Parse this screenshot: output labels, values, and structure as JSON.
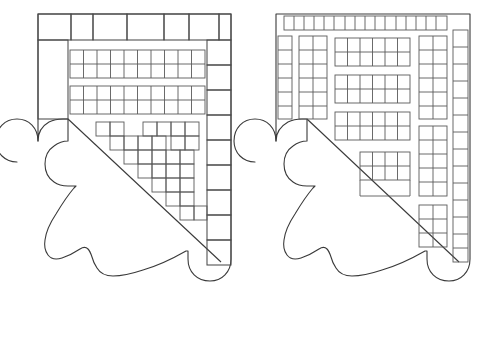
{
  "document": {
    "title": "Corbel Brick Coursing Patterns",
    "background_color": "#ffffff",
    "line_color": "#3a3a3a",
    "brick_line_color": "#4a4a4a",
    "width": 487,
    "height": 342
  },
  "figures": [
    {
      "id": "figure-left",
      "name": "left-corbel-diagram",
      "label": "",
      "description": "Corbel bracket outline with coarse brick coursing, diagonal cut and curved lower profile",
      "origin": {
        "x": 18,
        "y": 8
      },
      "outline": {
        "top_y": 14,
        "left_x": 38,
        "right_x": 231,
        "diagonal_from": {
          "x": 63,
          "y": 119
        },
        "diagonal_to": {
          "x": 221,
          "y": 265
        }
      },
      "courses": {
        "top_row": {
          "cells": 6,
          "rows": 1,
          "widths": [
            33,
            22,
            34,
            37,
            25,
            30
          ]
        },
        "right_column": {
          "cells": 9,
          "rows": 9,
          "columns": 1
        },
        "left_column": {
          "cells": 1,
          "rows": 1,
          "columns": 1
        },
        "band_1": {
          "rows": 2,
          "columns": 10
        },
        "band_2": {
          "rows": 2,
          "columns": 10
        },
        "stepped_region_blocks": 14
      },
      "profile_points": "curved corbel with three lobes"
    },
    {
      "id": "figure-right",
      "name": "right-corbel-diagram",
      "label": "",
      "description": "Corbel bracket outline with fine brick coursing, diagonal cut and curved lower profile",
      "origin": {
        "x": 272,
        "y": 8
      },
      "outline": {
        "top_y": 14,
        "left_x": 276,
        "right_x": 470,
        "diagonal_from": {
          "x": 301,
          "y": 119
        },
        "diagonal_to": {
          "x": 459,
          "y": 265
        }
      },
      "courses": {
        "top_row": {
          "cells": 16,
          "rows": 1,
          "columns": 16
        },
        "right_column": {
          "cells": 14,
          "rows": 14,
          "columns": 1
        },
        "left_column_outer": {
          "cells": 6,
          "rows": 6,
          "columns": 1
        },
        "left_column_inner": {
          "cells": 12,
          "rows": 6,
          "columns": 2
        },
        "inner_right_column": {
          "rows": 12,
          "columns": 2
        },
        "band_1": {
          "rows": 2,
          "columns": 6
        },
        "band_2": {
          "rows": 2,
          "columns": 6
        },
        "band_3": {
          "rows": 2,
          "columns": 6
        },
        "band_4": {
          "rows": 2,
          "columns": 4
        }
      },
      "profile_points": "curved corbel with three lobes"
    }
  ]
}
